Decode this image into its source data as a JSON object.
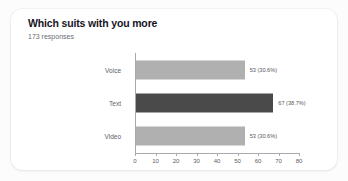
{
  "card": {
    "title": "Which suits with you more",
    "subtitle": "173 responses"
  },
  "colors": {
    "page_background": "#fcfcfd",
    "card_background": "#ffffff",
    "title_color": "#15151f",
    "subtitle_color": "#6a6a72",
    "axis_color": "#a9a9b0",
    "tick_label_color": "#5c5c64",
    "bar_light": "#b0b0b0",
    "bar_dark": "#4a4a4a"
  },
  "chart_data": {
    "type": "bar",
    "orientation": "horizontal",
    "title": "Which suits with you more",
    "subtitle": "173 responses",
    "total_responses": 173,
    "categories": [
      "Voice",
      "Text",
      "Video"
    ],
    "values": [
      53,
      67,
      53
    ],
    "percentages": [
      30.6,
      38.7,
      30.6
    ],
    "data_labels": [
      "53 (30.6%)",
      "67 (38.7%)",
      "53 (30.6%)"
    ],
    "bar_colors": [
      "#b0b0b0",
      "#4a4a4a",
      "#b0b0b0"
    ],
    "xlabel": "",
    "ylabel": "",
    "xlim": [
      0,
      80
    ],
    "xticks": [
      0,
      10,
      20,
      30,
      40,
      50,
      60,
      70,
      80
    ],
    "xtick_labels": [
      "0",
      "10",
      "20",
      "30",
      "40",
      "50",
      "60",
      "70",
      "80"
    ],
    "grid": false,
    "legend": false
  }
}
